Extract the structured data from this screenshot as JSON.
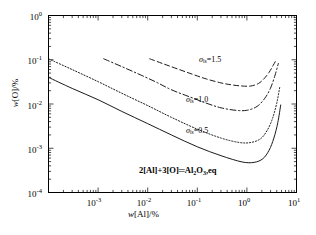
{
  "chart_data": {
    "type": "line",
    "title": "",
    "xlabel": "w[Al]/%",
    "ylabel": "w[O]/%",
    "xlim": [
      0.0001,
      10
    ],
    "ylim": [
      0.0001,
      1
    ],
    "xscale": "log",
    "yscale": "log",
    "grid": false,
    "legend": "none (inline annotations)",
    "xticks": [
      "10-3",
      "10-2",
      "10-1",
      "100",
      "101"
    ],
    "xtick_labels": [
      {
        "mant": "10",
        "exp": "-3"
      },
      {
        "mant": "10",
        "exp": "-2"
      },
      {
        "mant": "10",
        "exp": "-1"
      },
      {
        "mant": "10",
        "exp": "0"
      },
      {
        "mant": "10",
        "exp": "1"
      }
    ],
    "ytick_labels": [
      {
        "mant": "10",
        "exp": "0"
      },
      {
        "mant": "10",
        "exp": "-1"
      },
      {
        "mant": "10",
        "exp": "-2"
      },
      {
        "mant": "10",
        "exp": "-3"
      },
      {
        "mant": "10",
        "exp": "-4"
      }
    ],
    "series": [
      {
        "name": "sigma_ls=1.5",
        "label_symbol": "σ",
        "label_sub": "ls",
        "label_value": "1.5",
        "label_text": "σls=1.5",
        "style": "dashed",
        "x": [
          0.011,
          0.02,
          0.04,
          0.08,
          0.15,
          0.3,
          0.5,
          0.8,
          1.2,
          1.7,
          2.2,
          2.8,
          3.4,
          3.9
        ],
        "y": [
          0.105,
          0.082,
          0.062,
          0.047,
          0.037,
          0.03,
          0.027,
          0.0255,
          0.0255,
          0.029,
          0.037,
          0.052,
          0.075,
          0.1
        ]
      },
      {
        "name": "sigma_ls=1.0",
        "label_symbol": "σ",
        "label_sub": "ls",
        "label_value": "1.0",
        "label_text": "σls=1.0",
        "style": "dashdot",
        "x": [
          0.0013,
          0.003,
          0.007,
          0.015,
          0.03,
          0.07,
          0.15,
          0.3,
          0.6,
          1.0,
          1.6,
          2.3,
          3.0,
          3.7,
          4.3
        ],
        "y": [
          0.105,
          0.07,
          0.046,
          0.031,
          0.021,
          0.0145,
          0.0105,
          0.0082,
          0.0072,
          0.0072,
          0.0088,
          0.0135,
          0.023,
          0.045,
          0.082
        ]
      },
      {
        "name": "sigma_ls=0.5",
        "label_symbol": "σ",
        "label_sub": "ls",
        "label_value": "0.5",
        "label_text": "σls=0.5",
        "style": "dotted",
        "x": [
          0.0001,
          0.0003,
          0.001,
          0.003,
          0.01,
          0.03,
          0.1,
          0.3,
          0.7,
          1.2,
          1.9,
          2.6,
          3.3,
          4.0,
          4.6
        ],
        "y": [
          0.105,
          0.06,
          0.032,
          0.0175,
          0.0092,
          0.005,
          0.0027,
          0.0017,
          0.00135,
          0.00135,
          0.00165,
          0.0026,
          0.0048,
          0.0105,
          0.024
        ]
      },
      {
        "name": "2[Al]+3[O]=Al2O3,eq",
        "label_text": "2[Al]+3[O]=Al2O3,eq",
        "style": "solid",
        "x": [
          0.0001,
          0.0003,
          0.001,
          0.003,
          0.01,
          0.03,
          0.1,
          0.3,
          0.8,
          1.4,
          2.1,
          2.8,
          3.5,
          4.2,
          4.8
        ],
        "y": [
          0.04,
          0.0225,
          0.0125,
          0.0068,
          0.0036,
          0.002,
          0.00108,
          0.00068,
          0.00049,
          0.00048,
          0.00058,
          0.0009,
          0.0017,
          0.0038,
          0.0095
        ]
      }
    ],
    "annotations": [
      {
        "id": "ann-sigma-15",
        "text": "σls=1.5"
      },
      {
        "id": "ann-sigma-10",
        "text": "σls=1.0"
      },
      {
        "id": "ann-sigma-05",
        "text": "σls=0.5"
      },
      {
        "id": "ann-equation",
        "text": "2[Al]+3[O]=Al2O3,eq"
      }
    ]
  },
  "axes": {
    "y_title": "w[O]/%",
    "x_title": "w[Al]/%"
  },
  "labels": {
    "sigma": "σ",
    "sub_ls": "ls",
    "eq_v15": "=1.5",
    "eq_v10": "=1.0",
    "eq_v05": "=0.5",
    "eq_lead": "2[Al]+3[O]",
    "eq_mid": "Al",
    "eq_sub2": "2",
    "eq_O": "O",
    "eq_sub3": "3",
    "eq_tail": ",eq",
    "eq_equals": "═",
    "y_w": "w",
    "y_rest": "[O]/%",
    "x_w": "w",
    "x_rest": "[Al]/%",
    "ten": "10"
  },
  "ticks": {
    "y": [
      {
        "mant": "10",
        "exp": "0"
      },
      {
        "mant": "10",
        "exp": "-1"
      },
      {
        "mant": "10",
        "exp": "-2"
      },
      {
        "mant": "10",
        "exp": "-3"
      },
      {
        "mant": "10",
        "exp": "-4"
      }
    ],
    "x": [
      {
        "mant": "10",
        "exp": "-3"
      },
      {
        "mant": "10",
        "exp": "-2"
      },
      {
        "mant": "10",
        "exp": "-1"
      },
      {
        "mant": "10",
        "exp": "0"
      },
      {
        "mant": "10",
        "exp": "1"
      }
    ]
  }
}
